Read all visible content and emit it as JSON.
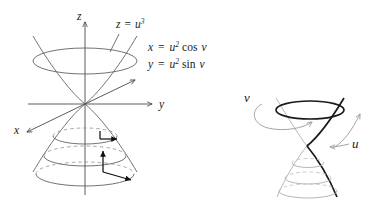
{
  "figure": {
    "background_color": "#ffffff",
    "ink_color": "#1a1a1a",
    "curve_color": "#5a5a5a",
    "light_curve_color": "#a8a8a8"
  },
  "left_panel": {
    "name": "axes-with-cuspidal-horn",
    "axes": [
      {
        "id": "z",
        "label": "z",
        "direction": "up"
      },
      {
        "id": "y",
        "label": "y",
        "direction": "right"
      },
      {
        "id": "x",
        "label": "x",
        "direction": "down-left"
      }
    ],
    "surface_label": {
      "z_of_u": "z",
      "equals": "=",
      "base": "u",
      "exponent": "3"
    },
    "equations": [
      {
        "lhs": "x",
        "equals": "=",
        "base": "u",
        "exponent": "2",
        "trig": "cos",
        "arg": "v"
      },
      {
        "lhs": "y",
        "equals": "=",
        "base": "u",
        "exponent": "2",
        "trig": "sin",
        "arg": "v"
      }
    ],
    "annotations": [
      {
        "name": "tangent-vector-pair-upper",
        "kind": "tangent-frame"
      },
      {
        "name": "tangent-vector-pair-lower",
        "kind": "tangent-frame"
      }
    ],
    "rim_style": "solid-ellipse",
    "hidden_arc_style": "dashed"
  },
  "right_panel": {
    "name": "coordinate-curves-horn",
    "labels": [
      {
        "id": "v",
        "text": "v",
        "meaning": "v-direction-circular"
      },
      {
        "id": "u",
        "text": "u",
        "meaning": "u-direction-along-profile"
      }
    ],
    "rim_style": "bold-ellipse",
    "hidden_arc_style": "dashed"
  }
}
